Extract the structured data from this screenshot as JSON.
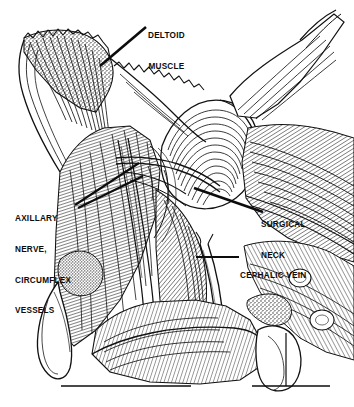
{
  "figure": {
    "kind": "anatomical-line-engraving",
    "region": "shoulder-deltopectoral-dissection",
    "background_color": "#ffffff",
    "ink_color": "#0c0c0c",
    "width": 354,
    "height": 407
  },
  "labels": {
    "deltoid_muscle": {
      "line1": "DELTOID",
      "line2": "MUSCLE"
    },
    "axillary": {
      "line1": "AXILLARY",
      "line2": "NERVE,",
      "line3": "CIRCUMFLEX",
      "line4": "VESSELS"
    },
    "surgical_neck": {
      "line1": "SURGICAL",
      "line2": "NECK"
    },
    "cephalic_vein": {
      "line1": "CEPHALIC VEIN"
    }
  },
  "leader_lines": [
    {
      "name": "deltoid-muscle-leader",
      "x1": 146,
      "y1": 27,
      "x2": 100,
      "y2": 66
    },
    {
      "name": "axillary-leader-upper",
      "x1": 75,
      "y1": 205,
      "x2": 139,
      "y2": 163
    },
    {
      "name": "axillary-leader-lower",
      "x1": 78,
      "y1": 208,
      "x2": 143,
      "y2": 176
    },
    {
      "name": "surgical-neck-leader",
      "x1": 194,
      "y1": 188,
      "x2": 263,
      "y2": 212
    },
    {
      "name": "cephalic-vein-leader",
      "x1": 196,
      "y1": 257,
      "x2": 239,
      "y2": 257
    }
  ],
  "baseline_rules": [
    {
      "name": "baseline-rule-left",
      "x1": 61,
      "y1": 386,
      "x2": 191,
      "y2": 386
    },
    {
      "name": "baseline-rule-right",
      "x1": 252,
      "y1": 386,
      "x2": 330,
      "y2": 386
    },
    {
      "name": "baseline-rule-vertical",
      "x1": 286,
      "y1": 333,
      "x2": 286,
      "y2": 386
    }
  ]
}
